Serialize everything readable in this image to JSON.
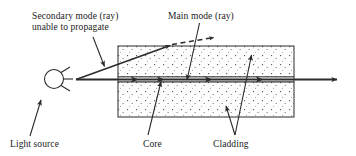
{
  "figure": {
    "background_color": "#ffffff",
    "line_color": "#2b2b2b",
    "cladding_fill_color": "#fdfdfd",
    "cladding_stipple_color": "#3a3a3a",
    "core_fill_color": "#ffffff",
    "width": 356,
    "height": 156
  },
  "labels": {
    "secondary_mode": "Secondary mode (ray)\nunable to propagate",
    "main_mode": "Main mode (ray)",
    "light_source": "Light source",
    "core": "Core",
    "cladding": "Cladding"
  },
  "components": {
    "light_source_symbol": "lamp-circle-with-rays",
    "fiber": {
      "left": 118,
      "right": 294,
      "top": 46,
      "bottom": 117,
      "core_top": 77,
      "core_bottom": 82
    }
  },
  "rays": {
    "main_mode": {
      "style": "solid",
      "description": "horizontal ray travelling along the core and exiting right",
      "arrow_count": 4
    },
    "secondary_mode": {
      "style": "solid-then-dashed",
      "description": "angled ray escaping through the upper cladding, dashed beyond the boundary"
    }
  },
  "leaders": [
    {
      "name": "secondary-mode-leader",
      "from": [
        93,
        38
      ],
      "to": [
        104,
        66
      ]
    },
    {
      "name": "main-mode-leader",
      "from": [
        199,
        23
      ],
      "to": [
        187,
        79
      ]
    },
    {
      "name": "light-source-leader",
      "from": [
        30,
        135
      ],
      "to": [
        40,
        100
      ]
    },
    {
      "name": "core-leader",
      "from": [
        148,
        134
      ],
      "to": [
        161,
        81
      ]
    },
    {
      "name": "cladding-leader-upper",
      "from": [
        235,
        134
      ],
      "to": [
        251,
        56
      ]
    },
    {
      "name": "cladding-leader-lower",
      "from": [
        235,
        134
      ],
      "to": [
        226,
        107
      ]
    }
  ]
}
